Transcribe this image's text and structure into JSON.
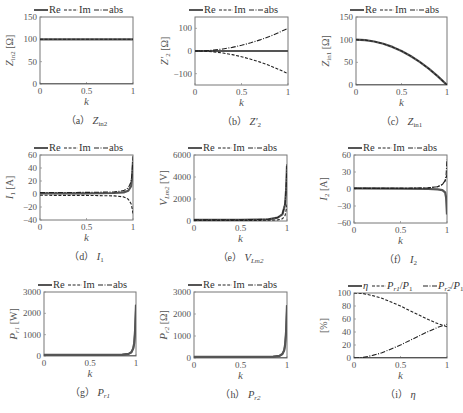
{
  "chart_data": [
    {
      "id": "a",
      "type": "line",
      "caption": "(a) Z_in2",
      "caption_label": "（a）",
      "caption_sym": "Z",
      "caption_sub": "in2",
      "caption_sub_italic": false,
      "ylabel_sym": "Z",
      "ylabel_sub": "in2",
      "ylabel_unit": "[Ω]",
      "xlabel": "k",
      "xlim": [
        0,
        1
      ],
      "ylim": [
        0,
        150
      ],
      "xticks": [
        0,
        0.5,
        1
      ],
      "xtick_labels": [
        "0",
        "0.5",
        "1"
      ],
      "yticks": [
        0,
        50,
        100,
        150
      ],
      "ytick_labels": [
        "0",
        "50",
        "100",
        "150"
      ],
      "legend": [
        "Re",
        "Im",
        "abs"
      ],
      "box": [
        40,
        17,
        133,
        84
      ],
      "series": [
        {
          "name": "Re",
          "style": "solid",
          "x": [
            0,
            0.25,
            0.5,
            0.75,
            1
          ],
          "y": [
            100,
            100,
            100,
            100,
            100
          ]
        },
        {
          "name": "Im",
          "style": "solid",
          "x": [
            0,
            0.5,
            1
          ],
          "y": [
            0,
            0,
            0
          ]
        },
        {
          "name": "abs",
          "style": "dashed",
          "x": [
            0,
            0.25,
            0.5,
            0.75,
            1
          ],
          "y": [
            100,
            100,
            100,
            100,
            100
          ]
        }
      ]
    },
    {
      "id": "b",
      "type": "line",
      "caption": "(b) Z'_2",
      "caption_label": "（b）",
      "caption_sym": "Z′",
      "caption_sub": "2",
      "caption_sub_italic": false,
      "ylabel_sym": "Z′",
      "ylabel_sub": "2",
      "ylabel_unit": "[Ω]",
      "xlabel": "k",
      "xlim": [
        0,
        1
      ],
      "ylim": [
        -150,
        150
      ],
      "xticks": [
        0,
        0.5,
        1
      ],
      "xtick_labels": [
        "0",
        "0.5",
        "1"
      ],
      "yticks": [
        -100,
        0,
        100
      ],
      "ytick_labels": [
        "−100",
        "0",
        "100"
      ],
      "legend": [
        "Re",
        "Im",
        "abs"
      ],
      "box": [
        195,
        17,
        288,
        85
      ],
      "series": [
        {
          "name": "Re",
          "style": "solid",
          "x": [
            0,
            0.5,
            1
          ],
          "y": [
            0,
            0,
            0
          ]
        },
        {
          "name": "Im",
          "style": "dashed",
          "x": [
            0,
            0.1,
            0.2,
            0.3,
            0.4,
            0.5,
            0.6,
            0.7,
            0.8,
            0.9,
            1
          ],
          "y": [
            0,
            -1,
            -4,
            -9,
            -16,
            -25,
            -36,
            -49,
            -64,
            -81,
            -100
          ]
        },
        {
          "name": "abs",
          "style": "dashdot",
          "x": [
            0,
            0.1,
            0.2,
            0.3,
            0.4,
            0.5,
            0.6,
            0.7,
            0.8,
            0.9,
            1
          ],
          "y": [
            0,
            1,
            4,
            9,
            16,
            25,
            36,
            49,
            64,
            81,
            100
          ]
        }
      ]
    },
    {
      "id": "c",
      "type": "line",
      "caption": "(c) Z_in1",
      "caption_label": "（c）",
      "caption_sym": "Z",
      "caption_sub": "in1",
      "caption_sub_italic": false,
      "ylabel_sym": "Z",
      "ylabel_sub": "in1",
      "ylabel_unit": "[Ω]",
      "xlabel": "k",
      "xlim": [
        0,
        1
      ],
      "ylim": [
        0,
        150
      ],
      "xticks": [
        0,
        0.5,
        1
      ],
      "xtick_labels": [
        "0",
        "0.5",
        "1"
      ],
      "yticks": [
        0,
        50,
        100,
        150
      ],
      "ytick_labels": [
        "0",
        "50",
        "100",
        "150"
      ],
      "legend": [
        "Re",
        "Im",
        "abs"
      ],
      "box": [
        356,
        17,
        447,
        85
      ],
      "series": [
        {
          "name": "Re",
          "style": "solid",
          "x": [
            0,
            0.1,
            0.2,
            0.3,
            0.4,
            0.5,
            0.6,
            0.7,
            0.8,
            0.9,
            1
          ],
          "y": [
            100,
            99,
            96,
            91,
            84,
            75,
            64,
            51,
            36,
            19,
            0
          ]
        },
        {
          "name": "Im",
          "style": "solid",
          "x": [
            0,
            0.5,
            1
          ],
          "y": [
            0,
            0,
            0
          ]
        },
        {
          "name": "abs",
          "style": "dashed",
          "x": [
            0,
            0.1,
            0.2,
            0.3,
            0.4,
            0.5,
            0.6,
            0.7,
            0.8,
            0.9,
            1
          ],
          "y": [
            100,
            99,
            96,
            91,
            84,
            75,
            64,
            51,
            36,
            19,
            0
          ]
        }
      ]
    },
    {
      "id": "d",
      "type": "line",
      "caption": "(d) I_1",
      "caption_label": "（d）",
      "caption_sym": "I",
      "caption_sub": "1",
      "caption_sub_italic": false,
      "ylabel_sym": "I",
      "ylabel_sub": "1",
      "ylabel_unit": "[A]",
      "xlabel": "k",
      "xlim": [
        0,
        1
      ],
      "ylim": [
        -40,
        60
      ],
      "xticks": [
        0,
        0.5,
        1
      ],
      "xtick_labels": [
        "0",
        "0.5",
        "1"
      ],
      "yticks": [
        -40,
        -20,
        0,
        20,
        40,
        60
      ],
      "ytick_labels": [
        "−40",
        "−20",
        "0",
        "20",
        "40",
        "60"
      ],
      "legend": [
        "Re",
        "Im",
        "abs"
      ],
      "box": [
        40,
        155,
        133,
        220
      ],
      "series": [
        {
          "name": "Re",
          "style": "solid",
          "x": [
            0,
            0.5,
            0.8,
            0.9,
            0.95,
            0.98,
            0.99,
            1
          ],
          "y": [
            1,
            1,
            1.5,
            2.5,
            5,
            12,
            25,
            50
          ]
        },
        {
          "name": "Im",
          "style": "dashed",
          "x": [
            0,
            0.5,
            0.8,
            0.9,
            0.95,
            0.98,
            0.99,
            1
          ],
          "y": [
            -2,
            -2.2,
            -3,
            -4.5,
            -8,
            -15,
            -22,
            -30
          ]
        },
        {
          "name": "abs",
          "style": "dashdot",
          "x": [
            0,
            0.5,
            0.8,
            0.9,
            0.95,
            0.98,
            0.99,
            1
          ],
          "y": [
            2.2,
            2.4,
            3.3,
            5.2,
            9.4,
            19,
            33,
            58
          ]
        }
      ]
    },
    {
      "id": "e",
      "type": "line",
      "caption": "(e) V_Lm2",
      "caption_label": "（e）",
      "caption_sym": "V",
      "caption_sub": "Lm2",
      "caption_sub_italic": true,
      "ylabel_sym": "V",
      "ylabel_sub": "Lm2",
      "ylabel_unit": "[V]",
      "xlabel": "k",
      "xlim": [
        0,
        1
      ],
      "ylim": [
        0,
        6000
      ],
      "xticks": [
        0,
        0.5,
        1
      ],
      "xtick_labels": [
        "0",
        "0.5",
        "1"
      ],
      "yticks": [
        0,
        2000,
        4000,
        6000
      ],
      "ytick_labels": [
        "0",
        "2000",
        "4000",
        "6000"
      ],
      "legend": [
        "Re",
        "Im",
        "abs"
      ],
      "box": [
        194,
        155,
        287,
        221
      ],
      "series": [
        {
          "name": "Re",
          "style": "solid",
          "x": [
            0,
            0.5,
            0.8,
            0.9,
            0.95,
            0.98,
            0.99,
            1
          ],
          "y": [
            100,
            100,
            150,
            300,
            600,
            1500,
            2800,
            5000
          ]
        },
        {
          "name": "Im",
          "style": "dashed",
          "x": [
            0,
            0.5,
            0.8,
            0.9,
            0.95,
            0.98,
            0.99,
            1
          ],
          "y": [
            50,
            50,
            60,
            100,
            200,
            500,
            1000,
            1500
          ]
        },
        {
          "name": "abs",
          "style": "dashdot",
          "x": [
            0,
            0.5,
            0.8,
            0.9,
            0.95,
            0.98,
            0.99,
            1
          ],
          "y": [
            110,
            110,
            160,
            320,
            630,
            1580,
            2970,
            5200
          ]
        }
      ]
    },
    {
      "id": "f",
      "type": "line",
      "caption": "(f) I_2",
      "caption_label": "（f）",
      "caption_sym": "I",
      "caption_sub": "2",
      "caption_sub_italic": false,
      "ylabel_sym": "I",
      "ylabel_sub": "2",
      "ylabel_unit": "[A]",
      "xlabel": "k",
      "xlim": [
        0,
        1
      ],
      "ylim": [
        -60,
        60
      ],
      "xticks": [
        0,
        0.5,
        1
      ],
      "xtick_labels": [
        "0",
        "0.5",
        "1"
      ],
      "yticks": [
        -60,
        -30,
        0,
        30,
        60
      ],
      "ytick_labels": [
        "−60",
        "−30",
        "0",
        "30",
        "60"
      ],
      "legend": [
        "Re",
        "Im",
        "abs"
      ],
      "box": [
        354,
        155,
        447,
        223
      ],
      "series": [
        {
          "name": "Re",
          "style": "solid",
          "x": [
            0,
            0.5,
            0.8,
            0.9,
            0.95,
            0.98,
            0.99,
            1
          ],
          "y": [
            1,
            0.5,
            0,
            -0.5,
            -2,
            -6,
            -15,
            -45
          ]
        },
        {
          "name": "Im",
          "style": "dashed",
          "x": [
            0,
            0.5,
            0.8,
            0.9,
            0.95,
            0.98,
            0.99,
            1
          ],
          "y": [
            1,
            1,
            2,
            4,
            8,
            14,
            20,
            25
          ]
        },
        {
          "name": "abs",
          "style": "dashdot",
          "x": [
            0,
            0.5,
            0.8,
            0.9,
            0.95,
            0.98,
            0.99,
            1
          ],
          "y": [
            1.4,
            1.2,
            2,
            4,
            8.2,
            15,
            25,
            52
          ]
        }
      ]
    },
    {
      "id": "g",
      "type": "line",
      "caption": "(g) P_r1",
      "caption_label": "（g）",
      "caption_sym": "P",
      "caption_sub": "r1",
      "caption_sub_italic": true,
      "ylabel_sym": "P",
      "ylabel_sub": "r1",
      "ylabel_unit": "[W]",
      "xlabel": "k",
      "xlim": [
        0,
        1
      ],
      "ylim": [
        0,
        3000
      ],
      "xticks": [
        0,
        0.5,
        1
      ],
      "xtick_labels": [
        "0",
        "0.5",
        "1"
      ],
      "yticks": [
        0,
        1000,
        2000,
        3000
      ],
      "ytick_labels": [
        "0",
        "1000",
        "2000",
        "3000"
      ],
      "legend": [
        "Re",
        "Im",
        "abs"
      ],
      "box": [
        44,
        292,
        136,
        356
      ],
      "series": [
        {
          "name": "Re",
          "style": "solid",
          "x": [
            0,
            0.5,
            0.85,
            0.92,
            0.95,
            0.97,
            0.98,
            0.99,
            1
          ],
          "y": [
            50,
            50,
            60,
            100,
            180,
            350,
            600,
            1200,
            2400
          ]
        },
        {
          "name": "Im",
          "style": "solid",
          "x": [
            0,
            0.5,
            1
          ],
          "y": [
            0,
            0,
            0
          ]
        },
        {
          "name": "abs",
          "style": "solid",
          "x": [
            0,
            0.5,
            0.85,
            0.92,
            0.95,
            0.97,
            0.98,
            0.99,
            1
          ],
          "y": [
            50,
            50,
            60,
            100,
            180,
            350,
            600,
            1200,
            2400
          ]
        }
      ]
    },
    {
      "id": "h",
      "type": "line",
      "caption": "(h) P_r2",
      "caption_label": "（h）",
      "caption_sym": "P",
      "caption_sub": "r2",
      "caption_sub_italic": true,
      "ylabel_sym": "P",
      "ylabel_sub": "r2",
      "ylabel_unit": "[Ω]",
      "xlabel": "k",
      "xlim": [
        0,
        1
      ],
      "ylim": [
        0,
        3000
      ],
      "xticks": [
        0,
        0.5,
        1
      ],
      "xtick_labels": [
        "0",
        "0.5",
        "1"
      ],
      "yticks": [
        0,
        1000,
        2000,
        3000
      ],
      "ytick_labels": [
        "0",
        "1000",
        "2000",
        "3000"
      ],
      "legend": [
        "Re",
        "Im",
        "abs"
      ],
      "box": [
        194,
        292,
        287,
        358
      ],
      "series": [
        {
          "name": "Re",
          "style": "solid",
          "x": [
            0,
            0.5,
            0.85,
            0.92,
            0.95,
            0.97,
            0.98,
            0.99,
            1
          ],
          "y": [
            50,
            50,
            60,
            100,
            180,
            350,
            600,
            1200,
            2400
          ]
        },
        {
          "name": "Im",
          "style": "solid",
          "x": [
            0,
            0.5,
            1
          ],
          "y": [
            0,
            0,
            0
          ]
        },
        {
          "name": "abs",
          "style": "solid",
          "x": [
            0,
            0.5,
            0.85,
            0.92,
            0.95,
            0.97,
            0.98,
            0.99,
            1
          ],
          "y": [
            50,
            50,
            60,
            100,
            180,
            350,
            600,
            1200,
            2400
          ]
        }
      ]
    },
    {
      "id": "i",
      "type": "line",
      "caption": "(i) η",
      "caption_label": "（i）",
      "caption_sym": "η",
      "caption_sub": "",
      "caption_sub_italic": false,
      "ylabel_sym": "",
      "ylabel_sub": "",
      "ylabel_unit": "[%]",
      "xlabel": "k",
      "xlim": [
        0,
        1
      ],
      "ylim": [
        0,
        100
      ],
      "xticks": [
        0,
        0.5,
        1
      ],
      "xtick_labels": [
        "0",
        "0.5",
        "1"
      ],
      "yticks": [
        0,
        20,
        40,
        60,
        80,
        100
      ],
      "ytick_labels": [
        "0",
        "20",
        "40",
        "60",
        "80",
        "100"
      ],
      "legend": [
        "η",
        "P_r1/P_1",
        "P_r2/P_1"
      ],
      "box": [
        354,
        293,
        447,
        358
      ],
      "series": [
        {
          "name": "η",
          "style": "solid",
          "x": [
            0,
            0.5,
            1
          ],
          "y": [
            0,
            0,
            0
          ]
        },
        {
          "name": "P_r1/P_1",
          "style": "dashed",
          "x": [
            0,
            0.1,
            0.2,
            0.3,
            0.4,
            0.5,
            0.6,
            0.7,
            0.8,
            0.9,
            1
          ],
          "y": [
            100,
            99,
            96,
            92,
            86,
            80,
            73,
            66,
            59,
            53,
            48
          ]
        },
        {
          "name": "P_r2/P_1",
          "style": "dashdot",
          "x": [
            0,
            0.1,
            0.2,
            0.3,
            0.4,
            0.5,
            0.6,
            0.7,
            0.8,
            0.9,
            1
          ],
          "y": [
            0,
            1,
            4,
            8,
            14,
            20,
            27,
            34,
            41,
            47,
            52
          ]
        }
      ]
    }
  ],
  "legend_styles": {
    "solid_color": "#555555",
    "dash_color": "#333333"
  }
}
